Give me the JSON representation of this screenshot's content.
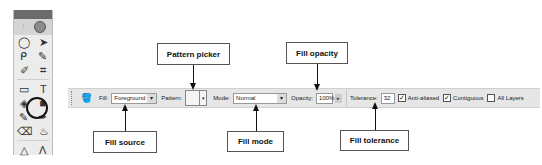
{
  "tools_panel": {
    "rows": [
      [
        "◯",
        "➤"
      ],
      [
        "ᑭ",
        "✎"
      ],
      [
        "✐",
        "⌗"
      ],
      [
        "▭",
        "T"
      ],
      [
        "◈",
        "■"
      ],
      [
        "✎",
        "✒"
      ],
      [
        "⌫",
        "♨"
      ],
      [
        "△",
        "Λ"
      ]
    ],
    "highlighted_tool": "paint-bucket"
  },
  "options_bar": {
    "tool_icon": "🪣",
    "fill_label": "Fill:",
    "fill_value": "Foreground",
    "pattern_label": "Pattern:",
    "mode_label": "Mode:",
    "mode_value": "Normal",
    "opacity_label": "Opacity:",
    "opacity_value": "100%",
    "tolerance_label": "Tolerance:",
    "tolerance_value": "32",
    "anti_aliased_label": "Anti-aliased",
    "anti_aliased_checked": true,
    "contiguous_label": "Contiguous",
    "contiguous_checked": true,
    "all_layers_label": "All Layers",
    "all_layers_checked": false
  },
  "callouts": {
    "pattern_picker": "Pattern picker",
    "fill_opacity": "Fill opacity",
    "fill_source": "Fill source",
    "fill_mode": "Fill mode",
    "fill_tolerance": "Fill tolerance"
  }
}
